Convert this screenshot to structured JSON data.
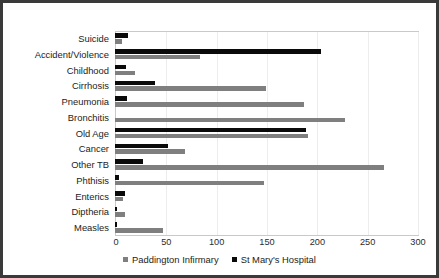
{
  "chart_data": {
    "type": "bar",
    "orientation": "horizontal",
    "title": "",
    "xlabel": "",
    "ylabel": "",
    "xlim": [
      0,
      300
    ],
    "xticks": [
      0,
      50,
      100,
      150,
      200,
      250,
      300
    ],
    "grid": true,
    "legend_position": "bottom",
    "categories": [
      "Suicide",
      "Accident/Violence",
      "Childhood",
      "Cirrhosis",
      "Pneumonia",
      "Bronchitis",
      "Old Age",
      "Cancer",
      "Other TB",
      "Phthisis",
      "Enterics",
      "Diptheria",
      "Measles"
    ],
    "series": [
      {
        "name": "St Mary's Hospital",
        "color": "#0a0a0a",
        "values": [
          13,
          205,
          11,
          40,
          12,
          0,
          190,
          53,
          28,
          4,
          10,
          2,
          2
        ]
      },
      {
        "name": "Paddington Infirmary",
        "color": "#7f7f7f",
        "values": [
          7,
          84,
          20,
          150,
          188,
          228,
          192,
          70,
          267,
          148,
          8,
          10,
          48
        ]
      }
    ]
  },
  "legend": {
    "items": [
      {
        "label": "Paddington Infirmary",
        "color": "#7f7f7f"
      },
      {
        "label": "St Mary's Hospital",
        "color": "#0a0a0a"
      }
    ]
  }
}
